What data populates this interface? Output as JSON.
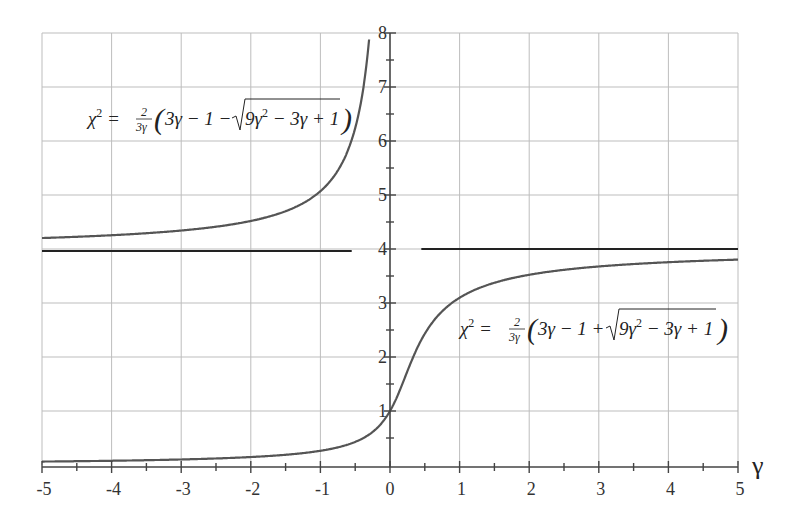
{
  "chart_data": {
    "type": "line",
    "title": "",
    "xlabel": "γ",
    "ylabel": "",
    "xlim": [
      -5,
      5
    ],
    "ylim": [
      0,
      8
    ],
    "grid": true,
    "x_ticks": [
      "-5",
      "-4",
      "-3",
      "-2",
      "-1",
      "0",
      "1",
      "2",
      "3",
      "4",
      "5"
    ],
    "y_ticks": [
      "1",
      "2",
      "3",
      "4",
      "5",
      "6",
      "7",
      "8"
    ],
    "series": [
      {
        "name": "χ² = (2/(3γ))(3γ − 1 − √(9γ² − 3γ + 1))",
        "branch": "minus",
        "x": [
          -5,
          -4,
          -3,
          -2,
          -1,
          -0.5,
          -0.35
        ],
        "values": [
          4.16,
          4.2,
          4.27,
          4.38,
          5.07,
          6.2,
          8.0
        ]
      },
      {
        "name": "χ² = (2/(3γ))(3γ − 1 + √(9γ² − 3γ + 1))",
        "branch": "plus",
        "x": [
          -5,
          -4,
          -3,
          -2,
          -1,
          -0.5,
          0,
          0.5,
          1,
          2,
          3,
          4,
          5
        ],
        "values": [
          0.05,
          0.06,
          0.08,
          0.12,
          0.26,
          0.47,
          1.0,
          2.47,
          3.1,
          3.56,
          3.7,
          3.77,
          3.82
        ]
      },
      {
        "name": "asymptote χ² = 4",
        "x": [
          -5,
          -0.55,
          0.45,
          5
        ],
        "values": [
          4,
          4,
          4,
          4
        ]
      }
    ],
    "annotations": [
      {
        "text": "χ² = (2/(3γ))(3γ − 1 − √(9γ² − 3γ + 1))",
        "position": "upper-left"
      },
      {
        "text": "χ² = (2/(3γ))(3γ − 1 + √(9γ² − 3γ + 1))",
        "position": "lower-right"
      }
    ]
  },
  "formulas": {
    "upper": {
      "lhs": "χ",
      "sup": "2",
      "eq": "=",
      "num": "2",
      "den": "3γ",
      "body": "3γ − 1 −",
      "rad": "9γ",
      "rad_sup": "2",
      "rad_tail": " − 3γ + 1"
    },
    "lower": {
      "lhs": "χ",
      "sup": "2",
      "eq": "=",
      "num": "2",
      "den": "3γ",
      "body": "3γ − 1 +",
      "rad": "9γ",
      "rad_sup": "2",
      "rad_tail": " − 3γ + 1"
    }
  }
}
